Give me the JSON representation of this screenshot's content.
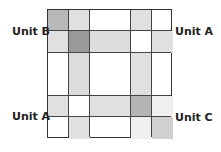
{
  "labels": {
    "top_left": "Unit B",
    "top_right": "Unit A",
    "bottom_left": "Unit A",
    "bottom_right": "Unit C"
  },
  "grid": {
    "columns": [
      0,
      21,
      42,
      83,
      104,
      125
    ],
    "rows": [
      0,
      21,
      43,
      86,
      107,
      129
    ],
    "cells": [
      {
        "c": 0,
        "r": 0,
        "color": "#b8b8b8"
      },
      {
        "c": 1,
        "r": 0,
        "color": "#e0e0e0"
      },
      {
        "c": 3,
        "r": 0,
        "color": "#e0e0e0"
      },
      {
        "c": 0,
        "r": 1,
        "color": "#e0e0e0"
      },
      {
        "c": 1,
        "r": 1,
        "color": "#999999"
      },
      {
        "c": 2,
        "r": 1,
        "color": "#dddddd"
      },
      {
        "c": 4,
        "r": 1,
        "color": "#e0e0e0"
      },
      {
        "c": 1,
        "r": 2,
        "color": "#dcdcdc"
      },
      {
        "c": 3,
        "r": 2,
        "color": "#e0e0e0"
      },
      {
        "c": 0,
        "r": 3,
        "color": "#e0e0e0"
      },
      {
        "c": 2,
        "r": 3,
        "color": "#e0e0e0"
      },
      {
        "c": 3,
        "r": 3,
        "color": "#b5b5b5"
      },
      {
        "c": 4,
        "r": 3,
        "color": "#f0f0f0"
      },
      {
        "c": 1,
        "r": 4,
        "color": "#e0e0e0"
      },
      {
        "c": 3,
        "r": 4,
        "color": "#f0f0f0"
      },
      {
        "c": 4,
        "r": 4,
        "color": "#d0d0d0"
      }
    ]
  }
}
